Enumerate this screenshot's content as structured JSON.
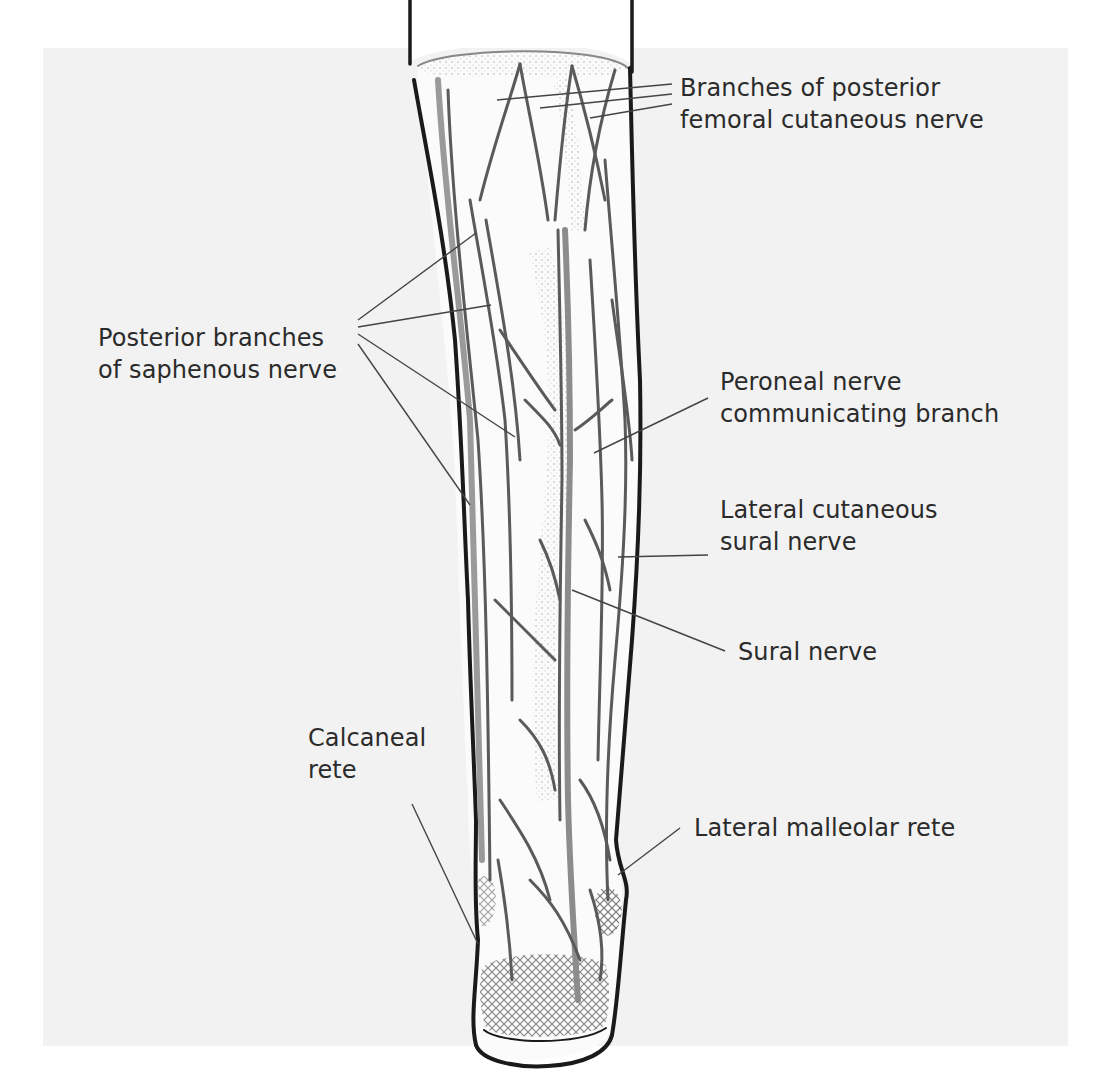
{
  "diagram": {
    "background_color": "#f2f2f2",
    "outline_color": "#1a1a1a",
    "nerve_color": "#555555",
    "leader_color": "#444444",
    "text_color": "#2b2b2b"
  },
  "labels": {
    "femoral": {
      "line1": "Branches of posterior",
      "line2": "femoral cutaneous nerve"
    },
    "saphenous": {
      "line1": "Posterior branches",
      "line2": "of saphenous nerve"
    },
    "peroneal": {
      "line1": "Peroneal nerve",
      "line2": "communicating branch"
    },
    "lateral_sural": {
      "line1": "Lateral cutaneous",
      "line2": "sural nerve"
    },
    "sural": {
      "line1": "Sural nerve"
    },
    "calcaneal": {
      "line1": "Calcaneal",
      "line2": "rete"
    },
    "malleolar": {
      "line1": "Lateral malleolar rete"
    }
  }
}
